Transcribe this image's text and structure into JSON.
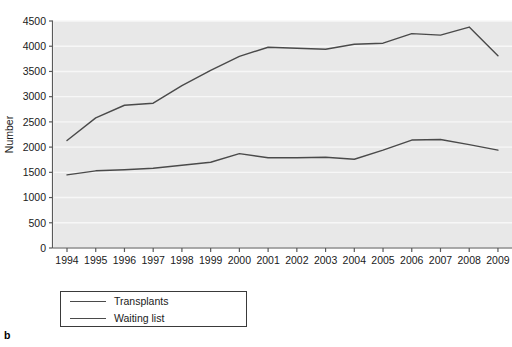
{
  "panel": {
    "letter": "b"
  },
  "legend": {
    "position": "below-left",
    "entries": [
      {
        "label": "Transplants",
        "color": "#4a4a4a"
      },
      {
        "label": "Waiting list",
        "color": "#4a4a4a"
      }
    ]
  },
  "chart_data": {
    "type": "line",
    "title": "",
    "xlabel": "",
    "ylabel": "Number",
    "x": [
      1994,
      1995,
      1996,
      1997,
      1998,
      1999,
      2000,
      2001,
      2002,
      2003,
      2004,
      2005,
      2006,
      2007,
      2008,
      2009
    ],
    "categories": [
      "1994",
      "1995",
      "1996",
      "1997",
      "1998",
      "1999",
      "2000",
      "2001",
      "2002",
      "2003",
      "2004",
      "2005",
      "2006",
      "2007",
      "2008",
      "2009"
    ],
    "series": [
      {
        "name": "Transplants",
        "color": "#4a4a4a",
        "values": [
          2130,
          2580,
          2830,
          2870,
          3220,
          3520,
          3800,
          3980,
          3960,
          3940,
          4040,
          4060,
          4250,
          4220,
          4380,
          3810
        ]
      },
      {
        "name": "Waiting list",
        "color": "#4a4a4a",
        "values": [
          1450,
          1530,
          1550,
          1580,
          1640,
          1700,
          1870,
          1790,
          1790,
          1800,
          1760,
          1940,
          2140,
          2150,
          2050,
          1940
        ]
      }
    ],
    "ylim": [
      0,
      4500
    ],
    "yticks": [
      0,
      500,
      1000,
      1500,
      2000,
      2500,
      3000,
      3500,
      4000,
      4500
    ],
    "ytick_labels": [
      "0",
      "500",
      "1000",
      "1500",
      "2000",
      "2500",
      "3000",
      "3500",
      "4000",
      "4500"
    ],
    "xlim": [
      1994,
      2009
    ],
    "grid": "horizontal",
    "plot_background": "#e8e8e8",
    "gridline_color": "#f7f7f7",
    "legend_position": "below-left"
  }
}
